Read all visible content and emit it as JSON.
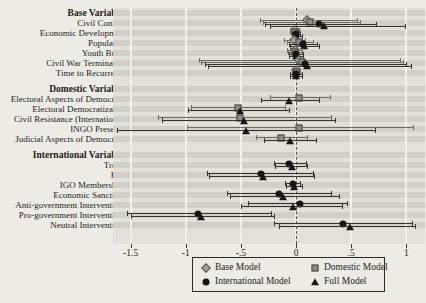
{
  "chart_data": {
    "type": "forest-coefficient-plot",
    "xlim": [
      -1.66,
      1.17
    ],
    "zero_reference": 0,
    "grid": "on",
    "ticks": [
      {
        "value": -1.5,
        "label": "-1.5"
      },
      {
        "value": -1.0,
        "label": "-1"
      },
      {
        "value": -0.5,
        "label": "-.5"
      },
      {
        "value": 0.0,
        "label": "0"
      },
      {
        "value": 0.5,
        "label": ".5"
      },
      {
        "value": 1.0,
        "label": "1"
      }
    ],
    "legend_position": "bottom",
    "models": [
      {
        "id": "base",
        "name": "Base Model",
        "marker": "diamond",
        "fill": "#a3a29b",
        "line": "#6f6e66"
      },
      {
        "id": "domestic",
        "name": "Domestic Model",
        "marker": "square",
        "fill": "#8d8c85",
        "line": "#6f6e66"
      },
      {
        "id": "international",
        "name": "International Model",
        "marker": "circle",
        "fill": "#161614",
        "line": "#35342f"
      },
      {
        "id": "full",
        "name": "Full Model",
        "marker": "triangle",
        "fill": "#161614",
        "line": "#35342f"
      }
    ],
    "groups": [
      {
        "header": "Base Variables",
        "rows": [
          {
            "label": "Civil Conflict",
            "estimates": [
              {
                "model": "base",
                "est": 0.1,
                "lo": -0.33,
                "hi": 0.55
              },
              {
                "model": "domestic",
                "est": 0.13,
                "lo": -0.3,
                "hi": 0.58
              },
              {
                "model": "international",
                "est": 0.21,
                "lo": -0.28,
                "hi": 0.73
              },
              {
                "model": "full",
                "est": 0.25,
                "lo": -0.24,
                "hi": 0.99
              }
            ]
          },
          {
            "label": "Economic Development",
            "estimates": [
              {
                "model": "base",
                "est": -0.01,
                "lo": -0.05,
                "hi": 0.03
              },
              {
                "model": "domestic",
                "est": -0.01,
                "lo": -0.05,
                "hi": 0.04
              },
              {
                "model": "international",
                "est": 0.0,
                "lo": -0.04,
                "hi": 0.04
              },
              {
                "model": "full",
                "est": 0.0,
                "lo": -0.04,
                "hi": 0.05
              }
            ]
          },
          {
            "label": "Population",
            "estimates": [
              {
                "model": "base",
                "est": -0.02,
                "lo": -0.11,
                "hi": 0.08
              },
              {
                "model": "domestic",
                "est": 0.03,
                "lo": -0.08,
                "hi": 0.15
              },
              {
                "model": "international",
                "est": 0.06,
                "lo": -0.06,
                "hi": 0.19
              },
              {
                "model": "full",
                "est": 0.07,
                "lo": -0.05,
                "hi": 0.21
              }
            ]
          },
          {
            "label": "Youth Bulge",
            "estimates": [
              {
                "model": "base",
                "est": -0.01,
                "lo": -0.08,
                "hi": 0.05
              },
              {
                "model": "domestic",
                "est": -0.01,
                "lo": -0.07,
                "hi": 0.05
              },
              {
                "model": "international",
                "est": 0.0,
                "lo": -0.06,
                "hi": 0.06
              },
              {
                "model": "full",
                "est": 0.0,
                "lo": -0.06,
                "hi": 0.06
              }
            ]
          },
          {
            "label": "Civil War Termination",
            "estimates": [
              {
                "model": "base",
                "est": 0.03,
                "lo": -0.88,
                "hi": 0.94
              },
              {
                "model": "domestic",
                "est": 0.05,
                "lo": -0.86,
                "hi": 0.97
              },
              {
                "model": "international",
                "est": 0.08,
                "lo": -0.83,
                "hi": 1.0
              },
              {
                "model": "full",
                "est": 0.1,
                "lo": -0.8,
                "hi": 1.04
              }
            ]
          },
          {
            "label": "Time to Recurrence",
            "estimates": [
              {
                "model": "base",
                "est": 0.0,
                "lo": -0.04,
                "hi": 0.04
              },
              {
                "model": "domestic",
                "est": 0.0,
                "lo": -0.04,
                "hi": 0.04
              },
              {
                "model": "international",
                "est": 0.0,
                "lo": -0.05,
                "hi": 0.05
              },
              {
                "model": "full",
                "est": 0.0,
                "lo": -0.05,
                "hi": 0.05
              }
            ]
          }
        ]
      },
      {
        "header": "Domestic Variables",
        "rows": [
          {
            "label": "Electoral Aspects of Democracy",
            "estimates": [
              {
                "model": "domestic",
                "est": 0.03,
                "lo": -0.24,
                "hi": 0.31
              },
              {
                "model": "full",
                "est": -0.06,
                "lo": -0.32,
                "hi": 0.21
              }
            ]
          },
          {
            "label": "Electoral Democratization",
            "estimates": [
              {
                "model": "domestic",
                "est": -0.53,
                "lo": -0.95,
                "hi": -0.1
              },
              {
                "model": "full",
                "est": -0.51,
                "lo": -0.98,
                "hi": -0.06
              }
            ]
          },
          {
            "label": "Civil Resistance (International)",
            "estimates": [
              {
                "model": "domestic",
                "est": -0.51,
                "lo": -1.25,
                "hi": 0.32
              },
              {
                "model": "full",
                "est": -0.47,
                "lo": -1.22,
                "hi": 0.35
              }
            ]
          },
          {
            "label": "INGO Presence",
            "estimates": [
              {
                "model": "domestic",
                "est": 0.03,
                "lo": -0.99,
                "hi": 1.06
              },
              {
                "model": "full",
                "est": -0.45,
                "lo": -1.62,
                "hi": 0.72
              }
            ]
          },
          {
            "label": "Judicial Aspects of Democracy",
            "estimates": [
              {
                "model": "domestic",
                "est": -0.14,
                "lo": -0.36,
                "hi": 0.1
              },
              {
                "model": "full",
                "est": -0.05,
                "lo": -0.29,
                "hi": 0.18
              }
            ]
          }
        ]
      },
      {
        "header": "International Variables",
        "rows": [
          {
            "label": "Treaty",
            "estimates": [
              {
                "model": "international",
                "est": -0.06,
                "lo": -0.2,
                "hi": 0.09
              },
              {
                "model": "full",
                "est": -0.04,
                "lo": -0.19,
                "hi": 0.1
              }
            ]
          },
          {
            "label": "PTA",
            "estimates": [
              {
                "model": "international",
                "est": -0.32,
                "lo": -0.81,
                "hi": 0.15
              },
              {
                "model": "full",
                "est": -0.3,
                "lo": -0.79,
                "hi": 0.16
              }
            ]
          },
          {
            "label": "IGO Memberships",
            "estimates": [
              {
                "model": "international",
                "est": -0.03,
                "lo": -0.1,
                "hi": 0.04
              },
              {
                "model": "full",
                "est": -0.02,
                "lo": -0.09,
                "hi": 0.05
              }
            ]
          },
          {
            "label": "Economic Sanctions",
            "estimates": [
              {
                "model": "international",
                "est": -0.15,
                "lo": -0.63,
                "hi": 0.32
              },
              {
                "model": "full",
                "est": -0.12,
                "lo": -0.6,
                "hi": 0.39
              }
            ]
          },
          {
            "label": "Anti-government Interventions",
            "estimates": [
              {
                "model": "international",
                "est": 0.04,
                "lo": -0.44,
                "hi": 0.46
              },
              {
                "model": "full",
                "est": -0.03,
                "lo": -0.5,
                "hi": 0.42
              }
            ]
          },
          {
            "label": "Pro-government Interventions",
            "estimates": [
              {
                "model": "international",
                "est": -0.89,
                "lo": -1.53,
                "hi": -0.23
              },
              {
                "model": "full",
                "est": -0.86,
                "lo": -1.5,
                "hi": -0.2
              }
            ]
          },
          {
            "label": "Neutral Interventions",
            "estimates": [
              {
                "model": "international",
                "est": 0.43,
                "lo": -0.2,
                "hi": 1.05
              },
              {
                "model": "full",
                "est": 0.49,
                "lo": -0.15,
                "hi": 1.08
              }
            ]
          }
        ]
      }
    ]
  }
}
